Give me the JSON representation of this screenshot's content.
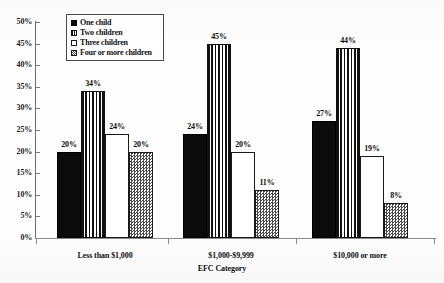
{
  "chart_data": {
    "type": "bar",
    "title": "",
    "subtitle": "",
    "xlabel": "EFC Category",
    "ylabel": "",
    "categories": [
      "Less than $1,000",
      "$1,000-$9,999",
      "$10,000 or more"
    ],
    "series": [
      {
        "name": "One child",
        "values": [
          20,
          24,
          27
        ],
        "pattern": "solid-black",
        "color": "#0b0b0b"
      },
      {
        "name": "Two children",
        "values": [
          34,
          45,
          44
        ],
        "pattern": "vertical-stripes",
        "color": "#111111"
      },
      {
        "name": "Three children",
        "values": [
          24,
          20,
          19
        ],
        "pattern": "open-white",
        "color": "#ffffff"
      },
      {
        "name": "Four or more children",
        "values": [
          20,
          11,
          8
        ],
        "pattern": "checker-dither",
        "color": "#4a4a4a"
      }
    ],
    "value_labels": [
      [
        "20%",
        "34%",
        "24%",
        "20%"
      ],
      [
        "24%",
        "45%",
        "20%",
        "11%"
      ],
      [
        "27%",
        "44%",
        "19%",
        "8%"
      ]
    ],
    "ylim": [
      0,
      50
    ],
    "ytick_values": [
      0,
      5,
      10,
      15,
      20,
      25,
      30,
      35,
      40,
      45,
      50
    ],
    "ytick_labels": [
      "0%",
      "5%",
      "10%",
      "15%",
      "20%",
      "25%",
      "30%",
      "35%",
      "40%",
      "45%",
      "50%"
    ],
    "grid": false,
    "legend_position": "upper-left-inside",
    "value_label_suffix": "%"
  },
  "legend": {
    "items": [
      {
        "label": "One child"
      },
      {
        "label": "Two children"
      },
      {
        "label": "Three children"
      },
      {
        "label": "Four or more children"
      }
    ]
  },
  "axes": {
    "x_title": "EFC Category"
  }
}
